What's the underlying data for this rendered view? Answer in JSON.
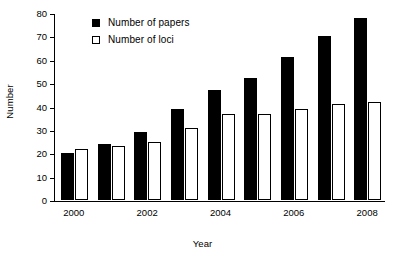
{
  "chart_data": {
    "type": "bar",
    "title": "",
    "xlabel": "Year",
    "ylabel": "Number",
    "categories": [
      "2000",
      "2001",
      "2002",
      "2003",
      "2004",
      "2005",
      "2006",
      "2007",
      "2008"
    ],
    "tick_labels_x": [
      "2000",
      "2002",
      "2004",
      "2006",
      "2008"
    ],
    "tick_labels_y": [
      "0",
      "10",
      "20",
      "30",
      "40",
      "50",
      "60",
      "70",
      "80"
    ],
    "ylim": [
      0,
      80
    ],
    "ytick_step": 10,
    "grid": false,
    "legend_position": "top-left-inside",
    "series": [
      {
        "name": "Number of papers",
        "style": "filled",
        "color": "#000000",
        "values": [
          20,
          24,
          29,
          39,
          47,
          52,
          61,
          70,
          78
        ]
      },
      {
        "name": "Number of loci",
        "style": "open",
        "color": "#ffffff",
        "edge_color": "#000000",
        "values": [
          22,
          23,
          25,
          31,
          37,
          37,
          39,
          41,
          42
        ]
      }
    ]
  },
  "legend": {
    "items": [
      {
        "label": "Number of papers",
        "swatch": "filled-square-icon"
      },
      {
        "label": "Number of loci",
        "swatch": "open-square-icon"
      }
    ]
  },
  "axes": {
    "y_title": "Number",
    "x_title": "Year"
  }
}
